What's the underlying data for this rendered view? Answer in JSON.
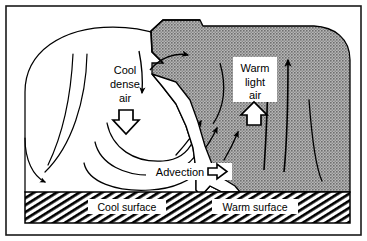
{
  "diagram": {
    "labels": {
      "cool_dense_air": [
        "Cool",
        "dense",
        "air"
      ],
      "warm_light_air": [
        "Warm",
        "light",
        "air"
      ],
      "advection": "Advection",
      "cool_surface": "Cool surface",
      "warm_surface": "Warm surface"
    },
    "icons": {
      "sinking_arrow": "hollow-down-arrow-icon",
      "rising_arrow": "hollow-up-arrow-icon",
      "advection_arrow": "hollow-right-arrow-icon",
      "front_wedge": "cold-front-wedge-icon"
    },
    "colors": {
      "warm_airmass_fill": "#9d9d9d",
      "outline": "#000000",
      "background": "#ffffff",
      "ground_hatch": "#000000",
      "label_box": "#ffffff"
    },
    "regions": [
      {
        "name": "cool-air-mass",
        "fill": "#ffffff",
        "side": "left"
      },
      {
        "name": "warm-air-mass",
        "fill": "#9d9d9d",
        "side": "right"
      },
      {
        "name": "ground-band",
        "fill": "hatched",
        "side": "bottom"
      }
    ],
    "flow": {
      "cool_air_motion": "sinking",
      "warm_air_motion": "rising",
      "surface_flow": "advection toward warm side",
      "vertical_arrow_count": 2,
      "convergent_arrow_count": 3
    }
  }
}
